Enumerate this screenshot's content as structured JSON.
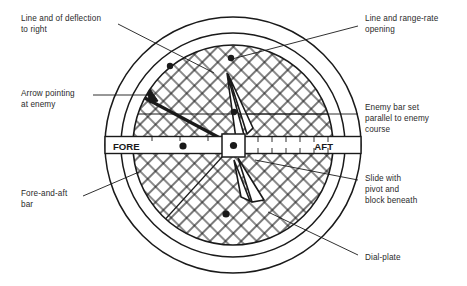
{
  "figure": {
    "type": "technical-diagram",
    "background_color": "#ffffff",
    "ink_color": "#1a1a1a"
  },
  "dial": {
    "center": {
      "x": 233,
      "y": 145
    },
    "outer_ring_radius": 128,
    "inner_ring_radius": 112,
    "hatched_disc_radius": 100,
    "hatch_spacing": 11,
    "hatch_angles": [
      45,
      -45
    ],
    "fore_label": "FORE",
    "aft_label": "AFT",
    "bar_half_length": 128,
    "bar_thickness": 17,
    "slide_block_size": 22,
    "pivot_radius": 3.6,
    "deflection_line_angle_deg": 208,
    "enemy_bar_y": 114,
    "markers": [
      {
        "name": "marker-upper-left",
        "x": 170,
        "y": 66,
        "r": 3.2
      },
      {
        "name": "marker-upper-right",
        "x": 231,
        "y": 58,
        "r": 3.2
      },
      {
        "name": "marker-mid-upper",
        "x": 234,
        "y": 112,
        "r": 3.2
      },
      {
        "name": "marker-fore-bar",
        "x": 183,
        "y": 146,
        "r": 3.4
      },
      {
        "name": "marker-lower",
        "x": 226,
        "y": 214,
        "r": 3.4
      }
    ]
  },
  "labels": {
    "deflection": {
      "id": "line-of-deflection",
      "text": "Line and of deflection\nto right",
      "x": 21,
      "y": 13
    },
    "arrow": {
      "id": "arrow-pointing-at-enemy",
      "text": "Arrow pointing\nat enemy",
      "x": 21,
      "y": 88
    },
    "fore_aft": {
      "id": "fore-and-aft-bar",
      "text": "Fore-and-aft\nbar",
      "x": 21,
      "y": 188
    },
    "range_rate": {
      "id": "line-and-range-rate-opening",
      "text": "Line and range-rate\nopening",
      "x": 365,
      "y": 13
    },
    "enemy_bar": {
      "id": "enemy-bar-set-parallel",
      "text": "Enemy bar set\nparallel to enemy\ncourse",
      "x": 365,
      "y": 102
    },
    "slide": {
      "id": "slide-with-pivot",
      "text": "Slide with\npivot and\nblock beneath",
      "x": 365,
      "y": 173
    },
    "dial_plate": {
      "id": "dial-plate",
      "text": "Dial-plate",
      "x": 365,
      "y": 252
    }
  },
  "leaders": [
    {
      "name": "leader-deflection",
      "x1": 118,
      "y1": 24,
      "x2": 214,
      "y2": 73
    },
    {
      "name": "leader-arrow",
      "x1": 93,
      "y1": 95,
      "x2": 150,
      "y2": 95
    },
    {
      "name": "leader-fore-aft",
      "x1": 83,
      "y1": 196,
      "x2": 136,
      "y2": 174
    },
    {
      "name": "leader-range-rate",
      "x1": 358,
      "y1": 26,
      "x2": 232,
      "y2": 59
    },
    {
      "name": "leader-enemy-bar",
      "x1": 358,
      "y1": 114,
      "x2": 236,
      "y2": 114
    },
    {
      "name": "leader-slide",
      "x1": 358,
      "y1": 180,
      "x2": 256,
      "y2": 159
    },
    {
      "name": "leader-dial-plate",
      "x1": 358,
      "y1": 255,
      "x2": 268,
      "y2": 213
    }
  ]
}
